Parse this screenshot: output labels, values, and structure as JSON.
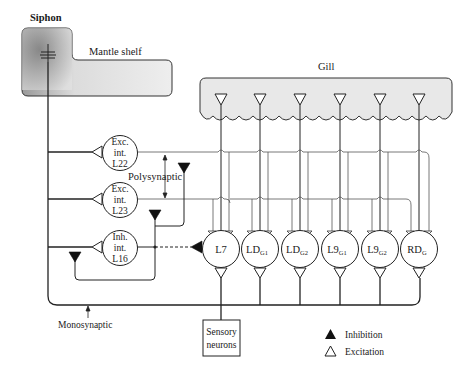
{
  "diagram": {
    "title_regions": {
      "siphon": "Siphon",
      "mantle_shelf": "Mantle shelf",
      "gill": "Gill"
    },
    "interneurons": [
      {
        "id": "L22",
        "line1": "Exc.",
        "line2": "int.",
        "line3": "L22",
        "type": "excitatory"
      },
      {
        "id": "L23",
        "line1": "Exc.",
        "line2": "int.",
        "line3": "L23",
        "type": "excitatory"
      },
      {
        "id": "L16",
        "line1": "Inh.",
        "line2": "int.",
        "line3": "L16",
        "type": "inhibitory"
      }
    ],
    "motor_neurons": [
      {
        "id": "L7",
        "main": "L7",
        "sub": ""
      },
      {
        "id": "LDG1",
        "main": "LD",
        "sub": "G1"
      },
      {
        "id": "LDG2",
        "main": "LD",
        "sub": "G2"
      },
      {
        "id": "L9G1",
        "main": "L9",
        "sub": "G1"
      },
      {
        "id": "L9G2",
        "main": "L9",
        "sub": "G2"
      },
      {
        "id": "RDG",
        "main": "RD",
        "sub": "G"
      }
    ],
    "sensory": {
      "line1": "Sensory",
      "line2": "neurons"
    },
    "pathways": {
      "polysynaptic": "Polysynaptic",
      "monosynaptic": "Monosynaptic"
    },
    "legend": [
      {
        "symbol": "filled-triangle",
        "label": "Inhibition"
      },
      {
        "symbol": "open-triangle",
        "label": "Excitation"
      }
    ],
    "colors": {
      "line": "#222222",
      "shade_dark": "#8a8a8a",
      "shade_light": "#e4e4e4",
      "background": "#ffffff"
    }
  }
}
